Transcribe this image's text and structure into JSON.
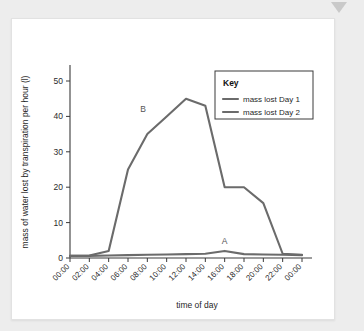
{
  "chart_data": {
    "type": "line",
    "title": "",
    "xlabel": "time of day",
    "ylabel": "mass of water lost by transpiration per hour (l)",
    "categories": [
      "00:00",
      "02:00",
      "04:00",
      "06:00",
      "08:00",
      "10:00",
      "12:00",
      "14:00",
      "16:00",
      "18:00",
      "20:00",
      "22:00",
      "00:00"
    ],
    "x_tick_labels": [
      "00:00",
      "02:00",
      "04:00",
      "06:00",
      "08:00",
      "10:00",
      "12:00",
      "14:00",
      "16:00",
      "18:00",
      "20:00",
      "22:00",
      "00:00"
    ],
    "y_tick_labels": [
      "0",
      "10",
      "20",
      "30",
      "40",
      "50"
    ],
    "y_ticks": [
      0,
      10,
      20,
      30,
      40,
      50
    ],
    "ylim": [
      0,
      50
    ],
    "grid": false,
    "legend_position": "top-right",
    "legend_title": "Key",
    "series": [
      {
        "name": "mass lost Day 1",
        "label_marker": "A",
        "color": "#6b6b6b",
        "values": [
          0.6,
          0.6,
          0.7,
          0.8,
          0.9,
          1.0,
          1.1,
          1.2,
          2.0,
          1.1,
          1.0,
          0.9,
          0.8
        ]
      },
      {
        "name": "mass lost Day 2",
        "label_marker": "B",
        "color": "#6b6b6b",
        "values": [
          0.6,
          0.7,
          2.0,
          25.0,
          35.0,
          40.0,
          45.0,
          43.0,
          20.0,
          20.0,
          15.5,
          1.2,
          0.9
        ]
      }
    ],
    "annotations": [
      {
        "text": "A",
        "x_index": 8,
        "value": 2.0,
        "note": "label for Day 1 curve near 16:00"
      },
      {
        "text": "B",
        "x_index": 4.4,
        "value": 40.0,
        "note": "label for Day 2 curve between 08:00 and 10:00"
      }
    ],
    "legend_entries": [
      {
        "label": "mass lost Day 1",
        "color": "#6b6b6b"
      },
      {
        "label": "mass lost Day 2",
        "color": "#6b6b6b"
      }
    ]
  },
  "colors": {
    "page_background": "#ededed",
    "card_background": "#ffffff",
    "axis": "#3a3a3a",
    "line": "#6b6b6b",
    "text": "#1f1f1f"
  }
}
